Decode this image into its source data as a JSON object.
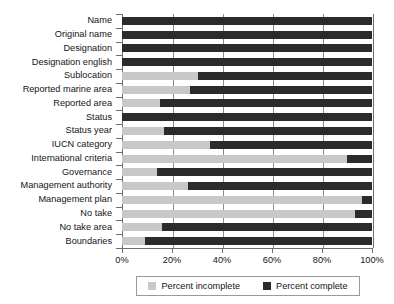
{
  "chart_data": {
    "type": "bar",
    "orientation": "horizontal",
    "stacked": true,
    "stacked_normalized": true,
    "title": "",
    "subtitle": "",
    "xlabel": "",
    "ylabel": "",
    "xlim": [
      0,
      100
    ],
    "ylim": null,
    "grid": true,
    "grid_axis": "x",
    "legend_position": "bottom",
    "xtick_labels": [
      "0%",
      "20%",
      "40%",
      "60%",
      "80%",
      "100%"
    ],
    "xtick_values": [
      0,
      20,
      40,
      60,
      80,
      100
    ],
    "categories": [
      "Name",
      "Original name",
      "Designation",
      "Designation english",
      "Sublocation",
      "Reported marine area",
      "Reported area",
      "Status",
      "Status year",
      "IUCN category",
      "International criteria",
      "Governance",
      "Management authority",
      "Management plan",
      "No take",
      "No take area",
      "Boundaries"
    ],
    "series": [
      {
        "name": "Percent incomplete",
        "color": "#c8c8c8",
        "values": [
          0,
          0,
          0,
          0,
          30.4,
          27.2,
          15.2,
          0,
          16.8,
          35.2,
          90.0,
          14.0,
          26.4,
          96.0,
          93.2,
          16.0,
          9.2
        ]
      },
      {
        "name": "Percent complete",
        "color": "#2b2b2b",
        "values": [
          100,
          100,
          100,
          100,
          69.6,
          72.8,
          84.8,
          100,
          83.2,
          64.8,
          10.0,
          86.0,
          73.6,
          4.0,
          6.8,
          84.0,
          90.8
        ]
      }
    ]
  },
  "legend": {
    "entries": [
      {
        "label": "Percent incomplete",
        "color": "#c8c8c8"
      },
      {
        "label": "Percent complete",
        "color": "#2b2b2b"
      }
    ]
  },
  "colors": {
    "incomplete": "#c8c8c8",
    "complete": "#2b2b2b",
    "axis": "#6e6e6e",
    "grid": "#8c8c8c",
    "background": "#ffffff",
    "text": "#141414"
  }
}
